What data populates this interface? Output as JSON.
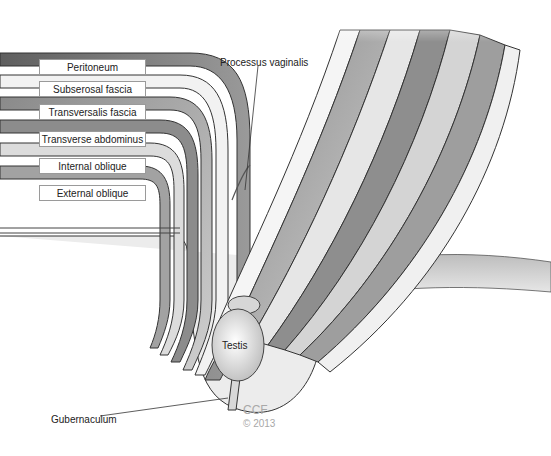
{
  "figure": {
    "layer_labels": [
      {
        "id": "peritoneum",
        "text": "Peritoneum"
      },
      {
        "id": "subserosal-fascia",
        "text": "Subserosal fascia"
      },
      {
        "id": "transversalis-fascia",
        "text": "Transversalis fascia"
      },
      {
        "id": "transverse-abdominus",
        "text": "Transverse abdominus"
      },
      {
        "id": "internal-oblique",
        "text": "Internal oblique"
      },
      {
        "id": "external-oblique",
        "text": "External oblique"
      }
    ],
    "callouts": {
      "processus_vaginalis": "Processus vaginalis",
      "testis": "Testis",
      "gubernaculum": "Gubernaculum"
    },
    "watermark": {
      "org": "CCF",
      "copyright": "© 2013"
    },
    "colors": {
      "background": "#ffffff",
      "layer_dark": "#6e6e6e",
      "layer_mid": "#9c9c9c",
      "layer_light": "#d8d8d8",
      "outline": "#333333",
      "watermark": "#a8a8a8"
    }
  }
}
